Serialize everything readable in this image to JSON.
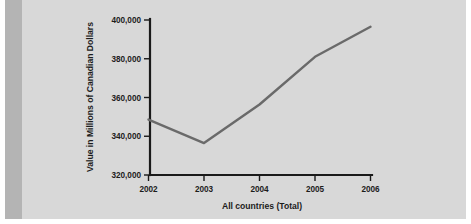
{
  "figure": {
    "background_color": "#d8d8d8",
    "accent_bar_color": "#b4b4b4",
    "line_color": "#6a6a6a",
    "axis_color": "#1a1a1a"
  },
  "chart_data": {
    "type": "line",
    "title": "",
    "subtitle": "",
    "xlabel": "All countries (Total)",
    "ylabel": "Value in Millions of Canadian Dollars",
    "categories": [
      "2002",
      "2003",
      "2004",
      "2005",
      "2006"
    ],
    "x": [
      2002,
      2003,
      2004,
      2005,
      2006
    ],
    "values": [
      348600,
      336500,
      356400,
      381000,
      396500
    ],
    "series": [
      {
        "name": "All countries (Total)",
        "values": [
          348600,
          336500,
          356400,
          381000,
          396500
        ]
      }
    ],
    "ylim": [
      320000,
      400000
    ],
    "yticks": [
      320000,
      340000,
      360000,
      380000,
      400000
    ],
    "ytick_labels": [
      "320,000",
      "340,000",
      "360,000",
      "380,000",
      "400,000"
    ],
    "xtick_labels": [
      "2002",
      "2003",
      "2004",
      "2005",
      "2006"
    ],
    "grid": false,
    "legend": false,
    "legend_position": "none"
  }
}
